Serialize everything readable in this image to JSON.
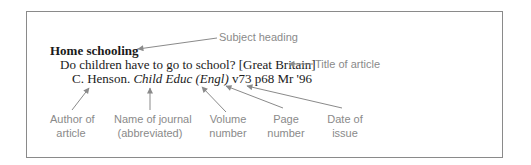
{
  "citation": {
    "subject_heading": "Home schooling",
    "article_title": "Do children have to go to school? [Great Britain]",
    "author": "C. Henson.",
    "journal": "Child Educ (Engl)",
    "volume": "v73",
    "page": "p68",
    "date": "Mr '96"
  },
  "annotations": {
    "subject_heading": "Subject heading",
    "title_of_article": "Title of article",
    "author_line1": "Author of",
    "author_line2": "article",
    "journal_line1": "Name of journal",
    "journal_line2": "(abbreviated)",
    "volume_line1": "Volume",
    "volume_line2": "number",
    "page_line1": "Page",
    "page_line2": "number",
    "date_line1": "Date of",
    "date_line2": "issue"
  },
  "colors": {
    "text": "#1a1a1a",
    "annotation": "#8a8a8a",
    "border": "#8a8a8a"
  }
}
